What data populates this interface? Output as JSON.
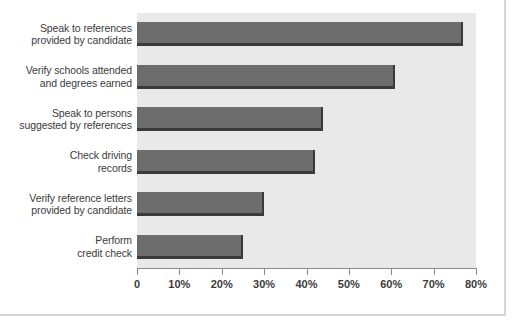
{
  "chart_data": {
    "type": "bar",
    "orientation": "horizontal",
    "title": "",
    "xlabel": "",
    "ylabel": "",
    "xlim": [
      0,
      80
    ],
    "grid": false,
    "legend": null,
    "categories": [
      "Speak to references provided by candidate",
      "Verify schools attended and degrees earned",
      "Speak to persons suggested by references",
      "Check driving records",
      "Verify reference letters provided by candidate",
      "Perform credit check"
    ],
    "category_lines": [
      [
        "Speak to references",
        "provided by candidate"
      ],
      [
        "Verify schools attended",
        "and degrees earned"
      ],
      [
        "Speak to persons",
        "suggested by references"
      ],
      [
        "Check driving",
        "records"
      ],
      [
        "Verify reference letters",
        "provided by candidate"
      ],
      [
        "Perform",
        "credit check"
      ]
    ],
    "values": [
      77,
      61,
      44,
      42,
      30,
      25
    ],
    "xticks": [
      0,
      10,
      20,
      30,
      40,
      50,
      60,
      70,
      80
    ],
    "xtick_labels": [
      "0",
      "10%",
      "20%",
      "30%",
      "40%",
      "50%",
      "60%",
      "70%",
      "80%"
    ],
    "colors": {
      "bar_fill": "#6d6d6d",
      "bar_edge": "#3a3a3a",
      "plot_background": "#e9e9e9",
      "card_background": "#ffffff",
      "text": "#3b3b3b",
      "axis": "#8a8a8a",
      "card_border": "#d6d6d6"
    }
  }
}
